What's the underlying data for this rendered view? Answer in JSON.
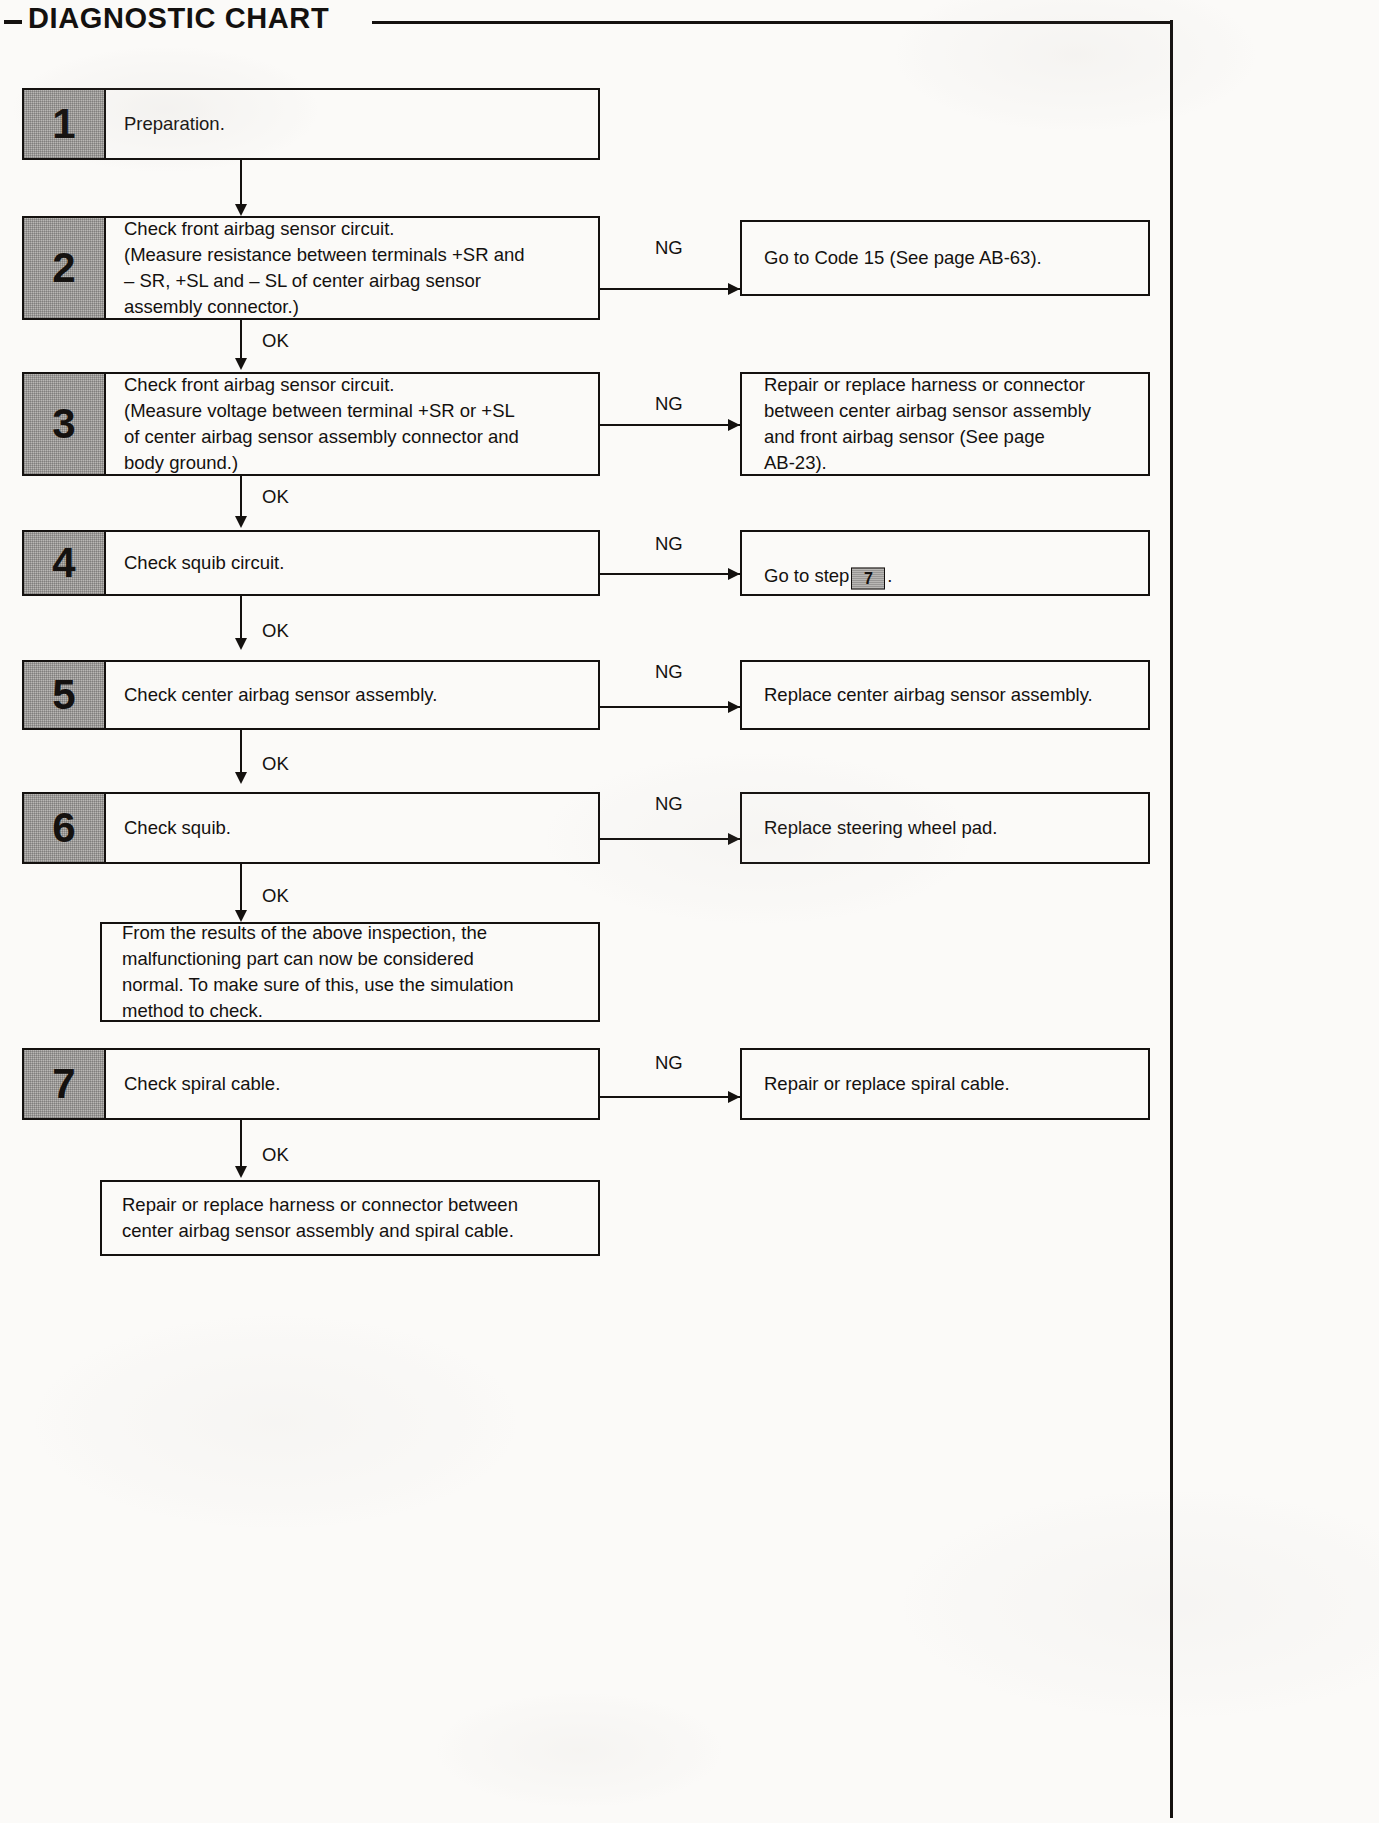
{
  "header": {
    "title": "DIAGNOSTIC CHART",
    "leading_dash": "–"
  },
  "steps": [
    {
      "number": "1",
      "text": "Preparation.",
      "ok_label": null,
      "ng_label": null,
      "ng_text": null
    },
    {
      "number": "2",
      "text": "Check front airbag sensor circuit.\n(Measure resistance between terminals +SR and\n– SR, +SL and – SL of center airbag sensor\nassembly connector.)",
      "ok_label": "OK",
      "ng_label": "NG",
      "ng_text": "Go to Code 15 (See page AB-63)."
    },
    {
      "number": "3",
      "text": "Check front airbag sensor circuit.\n(Measure voltage between terminal +SR or +SL\nof center airbag sensor assembly connector and\nbody ground.)",
      "ok_label": "OK",
      "ng_label": "NG",
      "ng_text": "Repair or replace harness or connector\nbetween center airbag sensor assembly\nand front airbag sensor (See page\nAB-23)."
    },
    {
      "number": "4",
      "text": "Check squib circuit.",
      "ok_label": "OK",
      "ng_label": "NG",
      "ng_text_before": "Go to step",
      "ng_step_ref": "7",
      "ng_text_after": "."
    },
    {
      "number": "5",
      "text": "Check center airbag sensor assembly.",
      "ok_label": "OK",
      "ng_label": "NG",
      "ng_text": "Replace center airbag sensor assembly."
    },
    {
      "number": "6",
      "text": "Check squib.",
      "ok_label": "OK",
      "ng_label": "NG",
      "ng_text": "Replace steering wheel pad."
    }
  ],
  "normal_note": {
    "text": "From the results of the above inspection, the\nmalfunctioning part can now be considered\nnormal. To make sure of this, use the simulation\nmethod to check."
  },
  "step7": {
    "number": "7",
    "text": "Check spiral cable.",
    "ok_label": "OK",
    "ng_label": "NG",
    "ng_text": "Repair or replace spiral cable."
  },
  "final": {
    "text": "Repair or replace harness or connector between\ncenter airbag sensor assembly and spiral cable."
  },
  "colors": {
    "ink": "#14110f",
    "badge_gray": "#b9b7b4",
    "paper": "#fbfaf8"
  }
}
